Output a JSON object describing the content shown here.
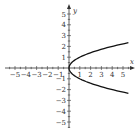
{
  "chart_data": {
    "type": "line",
    "title": "",
    "equation": "x = y^2",
    "xlabel": "x",
    "ylabel": "y",
    "xlim": [
      -5.5,
      5.8
    ],
    "ylim": [
      -5.6,
      5.6
    ],
    "xticks": [
      -5,
      -4,
      -3,
      -2,
      -1,
      1,
      2,
      3,
      4,
      5
    ],
    "yticks": [
      -5,
      -4,
      -3,
      -2,
      -1,
      1,
      2,
      3,
      4,
      5
    ],
    "xtick_labels": [
      "−5",
      "−4",
      "−3",
      "−2",
      "−1",
      "1",
      "2",
      "3",
      "4",
      "5"
    ],
    "ytick_labels": [
      "−5",
      "−4",
      "−3",
      "−2",
      "−1",
      "1",
      "2",
      "3",
      "4",
      "5"
    ],
    "grid": false,
    "legend": null,
    "series": [
      {
        "name": "x = y^2",
        "color": "#111111",
        "points": [
          [
            5.5,
            2.345
          ],
          [
            4,
            2
          ],
          [
            2.25,
            1.5
          ],
          [
            1,
            1
          ],
          [
            0.25,
            0.5
          ],
          [
            0,
            0
          ],
          [
            0.25,
            -0.5
          ],
          [
            1,
            -1
          ],
          [
            2.25,
            -1.5
          ],
          [
            4,
            -2
          ],
          [
            5.5,
            -2.345
          ]
        ]
      }
    ]
  },
  "style": {
    "axis_color": "#333333",
    "curve_color": "#111111"
  }
}
